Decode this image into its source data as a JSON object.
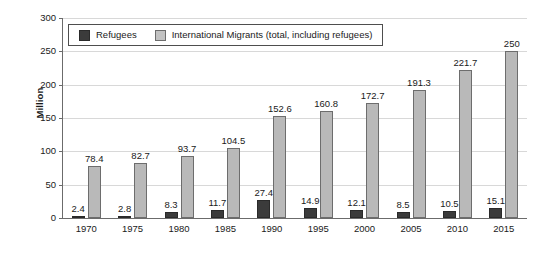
{
  "chart_data": {
    "type": "bar",
    "title": "",
    "xlabel": "",
    "ylabel": "Million",
    "ylim": [
      0,
      300
    ],
    "yticks": [
      "0",
      "50",
      "100",
      "150",
      "200",
      "250",
      "300"
    ],
    "grid": true,
    "legend_position": "top-left-inside",
    "categories": [
      "1970",
      "1975",
      "1980",
      "1985",
      "1990",
      "1995",
      "2000",
      "2005",
      "2010",
      "2015"
    ],
    "series": [
      {
        "name": "Refugees",
        "color": "#3b3b3b",
        "values": [
          2.4,
          2.8,
          8.3,
          11.7,
          27.4,
          14.9,
          12.1,
          8.5,
          10.5,
          15.1
        ],
        "labels": [
          "2.4",
          "2.8",
          "8.3",
          "11.7",
          "27.4",
          "14.9",
          "12.1",
          "8.5",
          "10.5",
          "15.1"
        ]
      },
      {
        "name": "International Migrants (total, including refugees)",
        "color": "#b9b9b9",
        "values": [
          78.4,
          82.7,
          93.7,
          104.5,
          152.6,
          160.8,
          172.7,
          191.3,
          221.7,
          250
        ],
        "labels": [
          "78.4",
          "82.7",
          "93.7",
          "104.5",
          "152.6",
          "160.8",
          "172.7",
          "191.3",
          "221.7",
          "250"
        ]
      }
    ]
  },
  "legend": {
    "items": [
      {
        "label": "Refugees",
        "swatch": "dark"
      },
      {
        "label": "International Migrants (total, including refugees)",
        "swatch": "light"
      }
    ]
  },
  "colors": {
    "refugees": "#3b3b3b",
    "migrants": "#b9b9b9",
    "axis": "#6b6b6b",
    "grid": "#d8d8d8",
    "text": "#1a1a1a",
    "background": "#ffffff"
  }
}
